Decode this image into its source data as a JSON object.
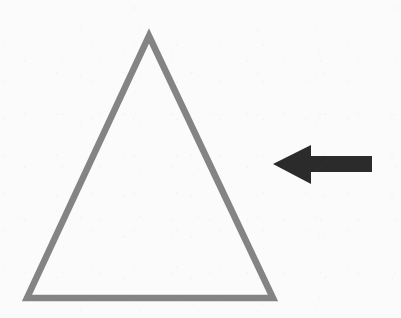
{
  "canvas": {
    "width": 401,
    "height": 318,
    "background_color": "#fbfbfb",
    "description": "Line drawing of a hollow triangle with a solid black arrow pointing left toward it"
  },
  "shapes": {
    "triangle": {
      "label": "triangle",
      "fill": "none",
      "stroke_color": "#848484",
      "stroke_width": 6.5,
      "points": "149,36 273,298 27,298",
      "apex": {
        "x": 149,
        "y": 36
      },
      "bottom_left": {
        "x": 27,
        "y": 298
      },
      "bottom_right": {
        "x": 273,
        "y": 298
      }
    },
    "arrow": {
      "label": "left arrow",
      "direction": "left",
      "fill": "#2b2b2b",
      "stroke": "none",
      "points": "273,164 311,145 311,156 372,156 372,172 311,172 311,184",
      "tip": {
        "x": 273,
        "y": 164
      },
      "tail": {
        "x": 372,
        "y": 164
      },
      "head_base_x": 311,
      "shaft_top_y": 156,
      "shaft_bottom_y": 172
    }
  }
}
